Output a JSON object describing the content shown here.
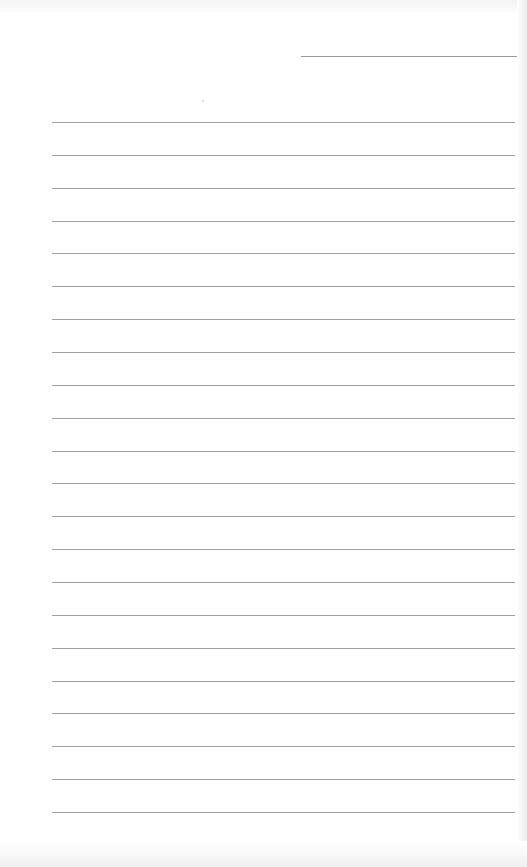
{
  "document": {
    "type": "lined-paper",
    "background_color": "#ffffff",
    "line_color": "#a0a0a0",
    "header_line": {
      "x": 301,
      "y": 56,
      "width": 216,
      "color": "#9a9a9a"
    },
    "ruled_lines": {
      "count": 22,
      "x": 52,
      "width": 463,
      "first_y": 122,
      "spacing": 32.86
    },
    "text": []
  }
}
